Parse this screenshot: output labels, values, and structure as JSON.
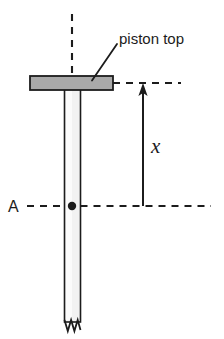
{
  "figure": {
    "background_color": "#ffffff",
    "stroke_color": "#1c1c1c"
  },
  "labels": {
    "piston_top": "piston top",
    "point_a": "A",
    "displacement": "x"
  },
  "parts": {
    "piston_plate": {
      "name": "piston top plate",
      "fill_color": "#a9a9a9",
      "stroke_color": "#1c1c1c"
    },
    "piston_rod": {
      "name": "piston rod",
      "fill_color": "#f2f2f2",
      "stroke_color": "#1c1c1c"
    },
    "centerline": {
      "name": "vertical axis of symmetry",
      "style": "dashed"
    },
    "top_level_line": {
      "name": "piston top level reference line",
      "style": "dashed"
    },
    "a_level_line": {
      "name": "point A reference level line",
      "style": "dashed"
    },
    "dimension_arrow": {
      "name": "displacement arrow",
      "direction": "up",
      "measures": "x"
    },
    "break_symbol": {
      "name": "zigzag break at rod bottom"
    },
    "point_marker": {
      "name": "point A dot",
      "fill_color": "#1c1c1c"
    },
    "leader_line": {
      "name": "leader line to piston top label"
    }
  }
}
